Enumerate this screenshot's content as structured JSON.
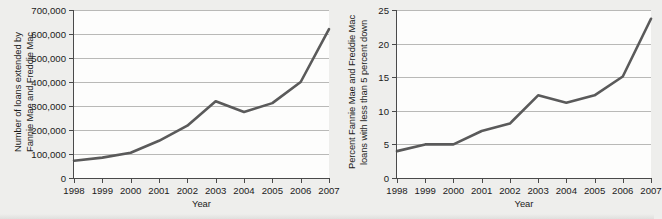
{
  "figure": {
    "background_color": "#eeeeec",
    "plot_background_color": "#fdfdfc",
    "line_color": "#5a5a5a",
    "grid_color": "#b9b9b7",
    "axis_color": "#4a4a4a"
  },
  "chart_data": [
    {
      "id": "loans-count",
      "type": "line",
      "title": "",
      "xlabel": "Year",
      "ylabel": "Number of loans extended by Fannie Mae and Freddie Mac",
      "ylabel_lines": [
        "Number of loans extended by",
        "Fannie Mae and Freddie Mac"
      ],
      "categories": [
        "1998",
        "1999",
        "2000",
        "2001",
        "2002",
        "2003",
        "2004",
        "2005",
        "2006",
        "2007"
      ],
      "x": [
        1998,
        1999,
        2000,
        2001,
        2002,
        2003,
        2004,
        2005,
        2006,
        2007
      ],
      "values": [
        72000,
        85000,
        105000,
        155000,
        218000,
        320000,
        275000,
        312000,
        400000,
        620000
      ],
      "ylim": [
        0,
        700000
      ],
      "xlim": [
        1998,
        2007
      ],
      "ytick_values": [
        0,
        100000,
        200000,
        300000,
        400000,
        500000,
        600000,
        700000
      ],
      "ytick_labels": [
        "0",
        "100,000",
        "200,000",
        "300,000",
        "400,000",
        "500,000",
        "600,000",
        "700,000"
      ],
      "grid": "horizontal",
      "legend": "none"
    },
    {
      "id": "loans-percent-low-down",
      "type": "line",
      "title": "",
      "xlabel": "Year",
      "ylabel": "Percent Fannie Mae and Freddie Mac loans with less than 5 percent down",
      "ylabel_lines": [
        "Percent Fannie Mae and Freddie Mac",
        "loans with less than 5 percent down"
      ],
      "categories": [
        "1998",
        "1999",
        "2000",
        "2001",
        "2002",
        "2003",
        "2004",
        "2005",
        "2006",
        "2007"
      ],
      "x": [
        1998,
        1999,
        2000,
        2001,
        2002,
        2003,
        2004,
        2005,
        2006,
        2007
      ],
      "values": [
        4.0,
        5.0,
        5.0,
        7.0,
        8.1,
        12.3,
        11.2,
        12.3,
        15.1,
        23.7
      ],
      "ylim": [
        0,
        25
      ],
      "xlim": [
        1998,
        2007
      ],
      "ytick_values": [
        0,
        5,
        10,
        15,
        20,
        25
      ],
      "ytick_labels": [
        "0",
        "5",
        "10",
        "15",
        "20",
        "25"
      ],
      "grid": "horizontal",
      "legend": "none"
    }
  ]
}
